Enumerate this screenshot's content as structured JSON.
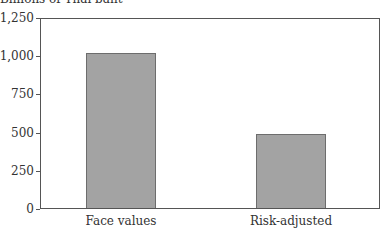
{
  "chart_data": {
    "type": "bar",
    "title": "",
    "ylabel": "Billions of Thai baht",
    "xlabel": "",
    "categories": [
      "Face values",
      "Risk-adjusted"
    ],
    "values": [
      1020,
      490
    ],
    "ylim": [
      0,
      1250
    ],
    "yticks": [
      0,
      250,
      500,
      750,
      1000,
      1250
    ],
    "ytick_labels": [
      "0",
      "250",
      "500",
      "750",
      "1,000",
      "1,250"
    ],
    "grid": false,
    "legend": null,
    "bar_color": "#a3a3a3",
    "bar_edge_color": "#6d6d6d"
  }
}
